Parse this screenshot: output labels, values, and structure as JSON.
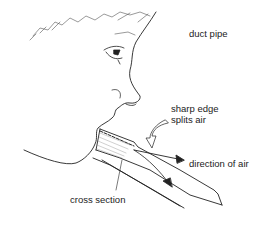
{
  "diagram": {
    "labels": {
      "duct_pipe": "duct pipe",
      "sharp_edge_line1": "sharp edge",
      "sharp_edge_line2": "splits air",
      "direction_of_air": "direction of air",
      "cross_section": "cross section"
    },
    "colors": {
      "line": "#222222",
      "background": "#ffffff"
    }
  }
}
